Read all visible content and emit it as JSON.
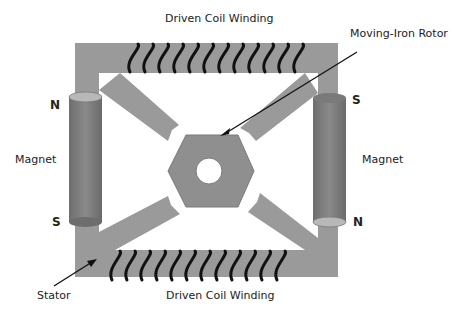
{
  "diagram": {
    "labels": {
      "top_coil": "Driven Coil Winding",
      "bottom_coil": "Driven Coil Winding",
      "rotor": "Moving-Iron Rotor",
      "left_magnet": "Magnet",
      "right_magnet": "Magnet",
      "stator": "Stator"
    },
    "poles": {
      "left_top": "N",
      "left_bottom": "S",
      "right_top": "S",
      "right_bottom": "N"
    },
    "colors": {
      "stator": "#9a9a9a",
      "magnet": "#7f7f7f",
      "magnet_cap": "#b8b8b8",
      "coil": "#111111",
      "arrow": "#111111",
      "text": "#222222"
    }
  }
}
